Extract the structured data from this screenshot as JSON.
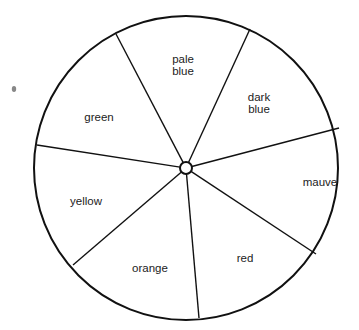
{
  "diagram": {
    "type": "color-wheel",
    "center": [
      186,
      168
    ],
    "radius": 152,
    "hub_radius": 6,
    "stroke_color": "#111111",
    "background": "#ffffff",
    "spoke_ends": [
      [
        116,
        34
      ],
      [
        250,
        29
      ],
      [
        339,
        128
      ],
      [
        316,
        254
      ],
      [
        199,
        318
      ],
      [
        73,
        265
      ],
      [
        37,
        145
      ]
    ],
    "segments": [
      {
        "name": "pale-blue",
        "lines": [
          "pale",
          "blue"
        ],
        "x": 183,
        "y": 65
      },
      {
        "name": "dark-blue",
        "lines": [
          "dark",
          "blue"
        ],
        "x": 259,
        "y": 103
      },
      {
        "name": "mauve",
        "lines": [
          "mauve"
        ],
        "x": 320,
        "y": 182
      },
      {
        "name": "red",
        "lines": [
          "red"
        ],
        "x": 245,
        "y": 258
      },
      {
        "name": "orange",
        "lines": [
          "orange"
        ],
        "x": 150,
        "y": 268
      },
      {
        "name": "yellow",
        "lines": [
          "yellow"
        ],
        "x": 86,
        "y": 201
      },
      {
        "name": "green",
        "lines": [
          "green"
        ],
        "x": 99,
        "y": 117
      }
    ],
    "speck": {
      "x": 14,
      "y": 89
    }
  }
}
